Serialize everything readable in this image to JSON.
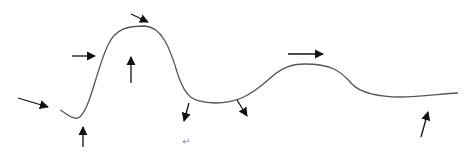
{
  "diagram": {
    "title_cut_off": "",
    "paragraph_mark": "↵",
    "curve_color": "#555555",
    "arrow_color": "#111111",
    "curve_path": "M 60 110 C 66 113, 72 120, 78 118 C 90 112, 96 70, 108 45 C 116 28, 128 26, 145 26 C 162 27, 170 48, 178 75 C 186 98, 192 102, 215 103 C 236 103, 250 96, 268 80 C 282 67, 292 64, 305 64 C 330 64, 340 70, 352 84 C 360 93, 380 97, 400 97 C 420 97, 440 94, 458 93",
    "arrows": [
      {
        "id": "arrow-1",
        "x1": 18,
        "y1": 98,
        "x2": 48,
        "y2": 107
      },
      {
        "id": "arrow-2",
        "x1": 83,
        "y1": 147,
        "x2": 83,
        "y2": 127
      },
      {
        "id": "arrow-3",
        "x1": 72,
        "y1": 56,
        "x2": 95,
        "y2": 56
      },
      {
        "id": "arrow-4",
        "x1": 131,
        "y1": 83,
        "x2": 131,
        "y2": 57
      },
      {
        "id": "arrow-5",
        "x1": 131,
        "y1": 14,
        "x2": 148,
        "y2": 22
      },
      {
        "id": "arrow-6",
        "x1": 189,
        "y1": 103,
        "x2": 184,
        "y2": 121
      },
      {
        "id": "arrow-7",
        "x1": 237,
        "y1": 100,
        "x2": 247,
        "y2": 116
      },
      {
        "id": "arrow-8",
        "x1": 288,
        "y1": 54,
        "x2": 323,
        "y2": 54
      },
      {
        "id": "arrow-9",
        "x1": 421,
        "y1": 137,
        "x2": 428,
        "y2": 112
      }
    ]
  }
}
